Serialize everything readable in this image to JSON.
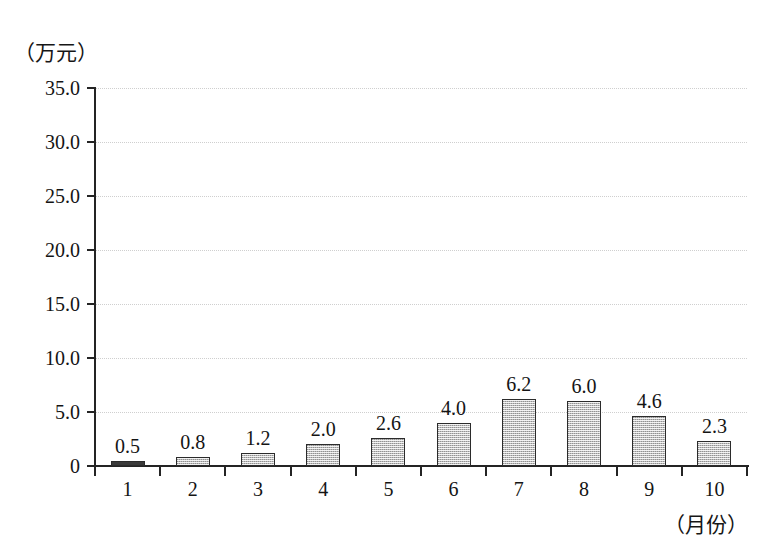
{
  "chart_data": {
    "type": "bar",
    "title": "",
    "subtitle": "",
    "xlabel": "（月份）",
    "ylabel": "（万元）",
    "categories": [
      "1",
      "2",
      "3",
      "4",
      "5",
      "6",
      "7",
      "8",
      "9",
      "10"
    ],
    "values": [
      0.5,
      0.8,
      1.2,
      2.0,
      2.6,
      4.0,
      6.2,
      6.0,
      4.6,
      2.3
    ],
    "value_labels": [
      "0.5",
      "0.8",
      "1.2",
      "2.0",
      "2.6",
      "4.0",
      "6.2",
      "6.0",
      "4.6",
      "2.3"
    ],
    "ylim": [
      0,
      35
    ],
    "y_ticks": [
      0,
      5,
      10,
      15,
      20,
      25,
      30,
      35
    ],
    "y_tick_labels": [
      "0",
      "5.0",
      "10.0",
      "15.0",
      "20.0",
      "25.0",
      "30.0",
      "35.0"
    ],
    "grid": true,
    "legend": false,
    "legend_position": "none",
    "bar_fill_color": "#bdbdbd",
    "bar_border_color": "#2b2b2b",
    "gridline_color": "#cfcfcf",
    "axis_color": "#242424",
    "background_color": "#ffffff"
  }
}
